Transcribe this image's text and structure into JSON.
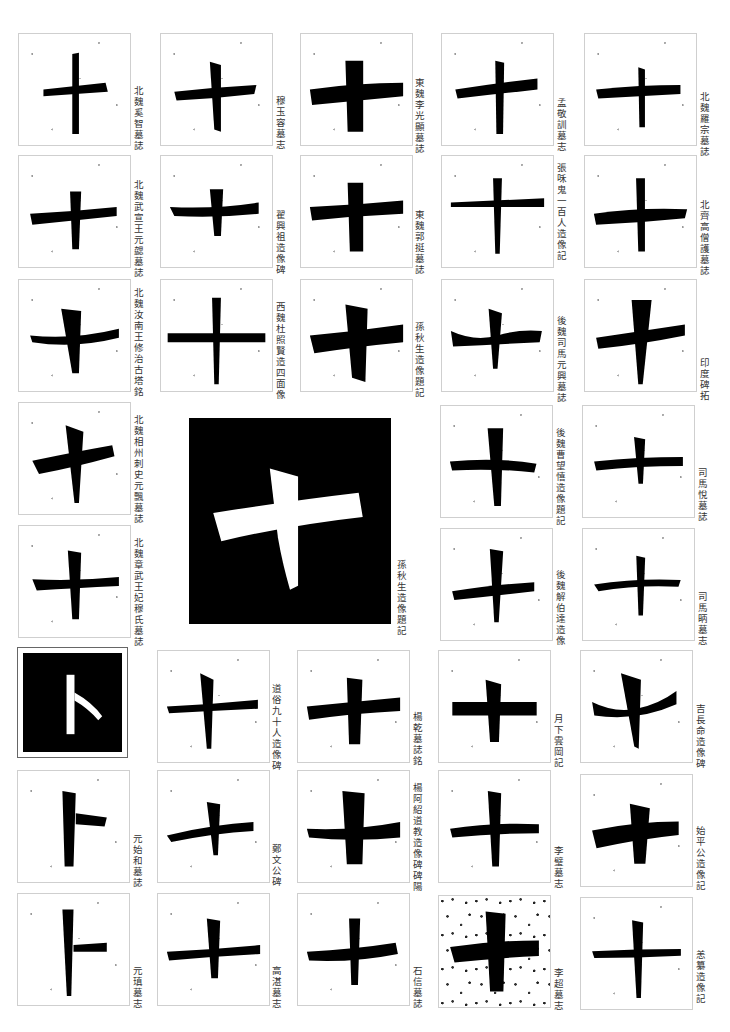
{
  "page": {
    "subject_character": "十",
    "variant_character": "卜",
    "background": "#ffffff",
    "ink": "#000000"
  },
  "samples": [
    {
      "id": 1,
      "glyph": "十",
      "caption": "北魏奚智墓誌"
    },
    {
      "id": 2,
      "glyph": "十",
      "caption": "穆玉容墓志"
    },
    {
      "id": 3,
      "glyph": "十",
      "caption": "東魏李光顯墓誌"
    },
    {
      "id": 4,
      "glyph": "十",
      "caption": "孟敬訓墓志"
    },
    {
      "id": 5,
      "glyph": "十",
      "caption": "北魏羅宗墓誌"
    },
    {
      "id": 6,
      "glyph": "十",
      "caption": "北魏武宣王元勰墓誌"
    },
    {
      "id": 7,
      "glyph": "十",
      "caption": "翟興祖造像碑"
    },
    {
      "id": 8,
      "glyph": "十",
      "caption": "東魏郭挺墓誌"
    },
    {
      "id": 9,
      "glyph": "十",
      "caption": "張咊鬼一百人造像記"
    },
    {
      "id": 10,
      "glyph": "十",
      "caption": "北齊高僧護墓誌"
    },
    {
      "id": 11,
      "glyph": "十",
      "caption": "北魏汝南王修治古塔銘"
    },
    {
      "id": 12,
      "glyph": "十",
      "caption": "西魏杜照賢造四面像"
    },
    {
      "id": 13,
      "glyph": "十",
      "caption": "孫秋生造像題記"
    },
    {
      "id": 14,
      "glyph": "十",
      "caption": "後魏司馬元興墓誌"
    },
    {
      "id": 15,
      "glyph": "十",
      "caption": "印度碑拓"
    },
    {
      "id": 16,
      "glyph": "十",
      "caption": "北魏相州刺史元飄墓誌"
    },
    {
      "id": 17,
      "glyph": "十",
      "caption": "孫秋生造像題記",
      "style": "inverse-large"
    },
    {
      "id": 18,
      "glyph": "十",
      "caption": "後魏曹望憘造像題記"
    },
    {
      "id": 19,
      "glyph": "十",
      "caption": "司馬悅墓誌"
    },
    {
      "id": 20,
      "glyph": "十",
      "caption": "北魏章武王妃穆氏墓誌"
    },
    {
      "id": 21,
      "glyph": "十",
      "caption": "後魏解伯達造像"
    },
    {
      "id": 22,
      "glyph": "十",
      "caption": "司馬昞墓志"
    },
    {
      "id": 23,
      "glyph": "卜",
      "caption": "",
      "style": "inverse-framed"
    },
    {
      "id": 24,
      "glyph": "十",
      "caption": "道俗九十人造像碑"
    },
    {
      "id": 25,
      "glyph": "十",
      "caption": "楊乾墓誌銘"
    },
    {
      "id": 26,
      "glyph": "十",
      "caption": "月下雲岡記"
    },
    {
      "id": 27,
      "glyph": "十",
      "caption": "吉長命造像碑"
    },
    {
      "id": 28,
      "glyph": "卜",
      "caption": "元始和墓誌"
    },
    {
      "id": 29,
      "glyph": "十",
      "caption": "鄭文公碑"
    },
    {
      "id": 30,
      "glyph": "十",
      "caption": "楊阿紹道教造像碑碑陽"
    },
    {
      "id": 31,
      "glyph": "十",
      "caption": "李璧墓志"
    },
    {
      "id": 32,
      "glyph": "十",
      "caption": "始平公造像記"
    },
    {
      "id": 33,
      "glyph": "卜",
      "caption": "元瑱墓志"
    },
    {
      "id": 34,
      "glyph": "十",
      "caption": "高湛墓志"
    },
    {
      "id": 35,
      "glyph": "十",
      "caption": "石信墓誌"
    },
    {
      "id": 36,
      "glyph": "十",
      "caption": "李超墓志"
    },
    {
      "id": 37,
      "glyph": "十",
      "caption": "恙纂造像記"
    }
  ]
}
